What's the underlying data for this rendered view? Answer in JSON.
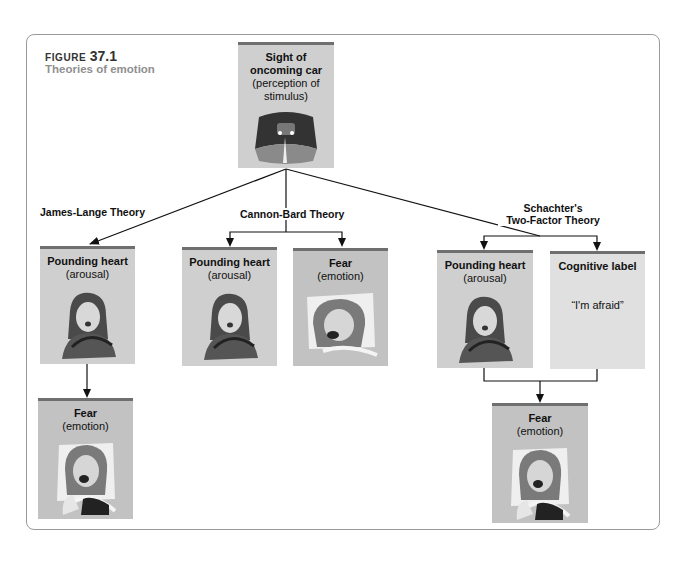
{
  "figure": {
    "label": "FIGURE",
    "number": "37.1",
    "title": "Theories of emotion"
  },
  "stimulus": {
    "title": "Sight of oncoming car",
    "subtitle": "(perception of stimulus)",
    "icon": "oncoming-car-image"
  },
  "theories": {
    "james_lange": {
      "name": "James-Lange Theory",
      "boxes": [
        {
          "title": "Pounding heart",
          "subtitle": "(arousal)",
          "icon": "aroused-man-face-image"
        },
        {
          "title": "Fear",
          "subtitle": "(emotion)",
          "icon": "frightened-woman-face-image"
        }
      ]
    },
    "cannon_bard": {
      "name": "Cannon-Bard Theory",
      "boxes": [
        {
          "title": "Pounding heart",
          "subtitle": "(arousal)",
          "icon": "aroused-man-face-image"
        },
        {
          "title": "Fear",
          "subtitle": "(emotion)",
          "icon": "frightened-woman-face-image"
        }
      ]
    },
    "schachter": {
      "name_line1": "Schachter's",
      "name_line2": "Two-Factor Theory",
      "boxes": [
        {
          "title": "Pounding heart",
          "subtitle": "(arousal)",
          "icon": "aroused-man-face-image"
        },
        {
          "title": "Cognitive label",
          "quote": "“I'm afraid”"
        },
        {
          "title": "Fear",
          "subtitle": "(emotion)",
          "icon": "frightened-woman-face-image"
        }
      ]
    }
  },
  "colors": {
    "box_fill": "#cfcfcf",
    "fear_fill": "#c2c2c2",
    "cognitive_fill": "#e0e0e0",
    "box_top_band": "#6f6f6f",
    "frame_border": "#9a9a9a",
    "title_gray": "#8f8f8f"
  }
}
